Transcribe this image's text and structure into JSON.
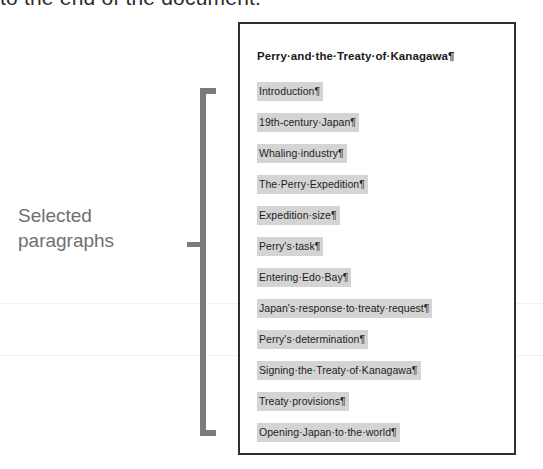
{
  "top_cut_text": "to the end of the document.",
  "caption": {
    "label": "Selected paragraphs"
  },
  "bracket": {
    "name": "selection-bracket"
  },
  "document": {
    "title": "Perry·and·the·Treaty·of·Kanagawa¶",
    "paragraphs": [
      {
        "text": "Introduction¶"
      },
      {
        "text": "19th-century·Japan¶"
      },
      {
        "text": "Whaling·industry¶"
      },
      {
        "text": "The·Perry·Expedition¶"
      },
      {
        "text": "Expedition·size¶"
      },
      {
        "text": "Perry's·task¶"
      },
      {
        "text": "Entering·Edo·Bay¶"
      },
      {
        "text": "Japan's·response·to·treaty·request¶"
      },
      {
        "text": "Perry's·determination¶"
      },
      {
        "text": "Signing·the·Treaty·of·Kanagawa¶"
      },
      {
        "text": "Treaty·provisions¶"
      },
      {
        "text": "Opening·Japan·to·the·world¶"
      }
    ]
  },
  "colors": {
    "highlight": "#d4d4d4",
    "bracket": "#7b7b7b",
    "caption_text": "#6f6f6f",
    "document_border": "#2f2f2f",
    "body_text": "#1d1d1d"
  }
}
